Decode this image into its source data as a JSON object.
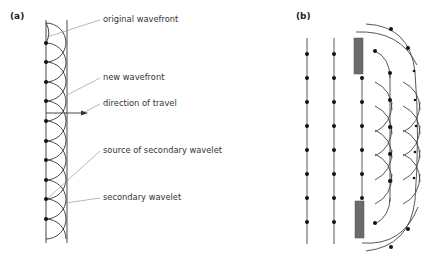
{
  "panels": {
    "a": {
      "label": "(a)",
      "annotations": {
        "original_wavefront": "original wavefront",
        "new_wavefront": "new wavefront",
        "direction_of_travel": "direction of travel",
        "source_of_secondary_wavelet": "source of secondary wavelet",
        "secondary_wavelet": "secondary wavelet"
      }
    },
    "b": {
      "label": "(b)"
    }
  },
  "colors": {
    "line": "#333333",
    "barrier": "#6b6b6b",
    "leader": "#888888"
  }
}
